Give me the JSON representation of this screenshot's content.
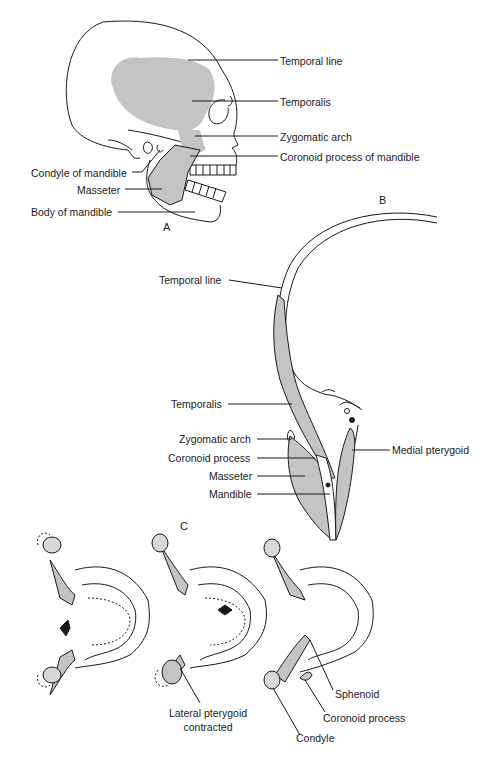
{
  "figure": {
    "panels": {
      "a": "A",
      "b": "B",
      "c": "C"
    },
    "colors": {
      "muscle_fill": "#c4c4c4",
      "line": "#1a1a1a",
      "background": "#ffffff"
    },
    "panel_a": {
      "title": "A",
      "view": "lateral skull",
      "labels": [
        {
          "id": "temporal_line",
          "text": "Temporal line"
        },
        {
          "id": "temporalis",
          "text": "Temporalis"
        },
        {
          "id": "zygomatic_arch",
          "text": "Zygomatic arch"
        },
        {
          "id": "coronoid_process",
          "text": "Coronoid process of mandible"
        },
        {
          "id": "condyle",
          "text": "Condyle of mandible"
        },
        {
          "id": "masseter",
          "text": "Masseter"
        },
        {
          "id": "body_of_mandible",
          "text": "Body of mandible"
        }
      ]
    },
    "panel_b": {
      "title": "B",
      "view": "coronal section",
      "labels": [
        {
          "id": "temporal_line",
          "text": "Temporal line"
        },
        {
          "id": "temporalis",
          "text": "Temporalis"
        },
        {
          "id": "zygomatic_arch",
          "text": "Zygomatic arch"
        },
        {
          "id": "coronoid_process",
          "text": "Coronoid process"
        },
        {
          "id": "masseter",
          "text": "Masseter"
        },
        {
          "id": "mandible",
          "text": "Mandible"
        },
        {
          "id": "medial_pterygoid",
          "text": "Medial pterygoid"
        }
      ]
    },
    "panel_c": {
      "title": "C",
      "view": "inferior view of mandible movement",
      "labels": [
        {
          "id": "lateral_pterygoid",
          "line1": "Lateral pterygoid",
          "line2": "contracted"
        },
        {
          "id": "sphenoid",
          "text": "Sphenoid"
        },
        {
          "id": "coronoid_process",
          "text": "Coronoid process"
        },
        {
          "id": "condyle",
          "text": "Condyle"
        }
      ]
    }
  }
}
